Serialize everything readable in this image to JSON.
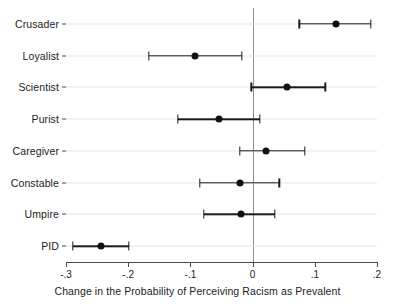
{
  "chart_data": {
    "type": "scatter",
    "title": "",
    "xlabel": "Change in the Probability of Perceiving Racism as Prevalent",
    "ylabel": "",
    "xlim": [
      -0.3,
      0.2
    ],
    "xticks": [
      -0.3,
      -0.2,
      -0.1,
      0,
      0.1,
      0.2
    ],
    "xticklabels": [
      "-.3",
      "-.2",
      "-.1",
      "0",
      ".1",
      ".2"
    ],
    "grid": "horizontal",
    "legend": "none",
    "reference_line": 0,
    "categories": [
      "Crusader",
      "Loyalist",
      "Scientist",
      "Purist",
      "Caregiver",
      "Constable",
      "Umpire",
      "PID"
    ],
    "points": [
      {
        "label": "Crusader",
        "estimate": 0.134,
        "ci_low": 0.075,
        "ci_high": 0.19
      },
      {
        "label": "Loyalist",
        "estimate": -0.092,
        "ci_low": -0.167,
        "ci_high": -0.017
      },
      {
        "label": "Scientist",
        "estimate": 0.055,
        "ci_low": -0.002,
        "ci_high": 0.117
      },
      {
        "label": "Purist",
        "estimate": -0.054,
        "ci_low": -0.12,
        "ci_high": 0.012
      },
      {
        "label": "Caregiver",
        "estimate": 0.022,
        "ci_low": -0.021,
        "ci_high": 0.084
      },
      {
        "label": "Constable",
        "estimate": -0.02,
        "ci_low": -0.085,
        "ci_high": 0.043
      },
      {
        "label": "Umpire",
        "estimate": -0.018,
        "ci_low": -0.078,
        "ci_high": 0.036
      },
      {
        "label": "PID",
        "estimate": -0.243,
        "ci_low": -0.289,
        "ci_high": -0.199
      }
    ]
  }
}
